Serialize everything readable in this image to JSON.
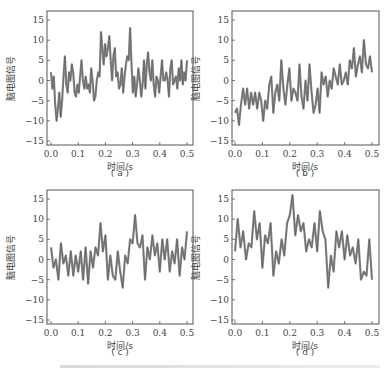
{
  "figure": {
    "ylabel": "脑电图信号",
    "xlabel": "时间/s",
    "caption_fragment": "……（部分被裁切的图注）"
  },
  "chart_data": [
    {
      "type": "line",
      "panel": "(a)",
      "xlabel": "时间/s",
      "ylabel": "脑电图信号",
      "xlim": [
        0,
        0.5
      ],
      "ylim": [
        -16,
        17
      ],
      "xticks": [
        "0.0",
        "0.1",
        "0.2",
        "0.3",
        "0.4",
        "0.5"
      ],
      "yticks": [
        "-15",
        "-10",
        "-5",
        "0",
        "5",
        "10",
        "15"
      ],
      "x": [
        0,
        0.01,
        0.02,
        0.025,
        0.03,
        0.035,
        0.04,
        0.045,
        0.05,
        0.055,
        0.06,
        0.065,
        0.07,
        0.075,
        0.08,
        0.085,
        0.09,
        0.095,
        0.1,
        0.105,
        0.11,
        0.115,
        0.12,
        0.125,
        0.13,
        0.135,
        0.14,
        0.145,
        0.15,
        0.155,
        0.16,
        0.165,
        0.17,
        0.175,
        0.18,
        0.185,
        0.19,
        0.195,
        0.2,
        0.205,
        0.21,
        0.215,
        0.22,
        0.225,
        0.23,
        0.235,
        0.24,
        0.245,
        0.25,
        0.255,
        0.26,
        0.265,
        0.27,
        0.275,
        0.28,
        0.285,
        0.29,
        0.295,
        0.3,
        0.305,
        0.31,
        0.315,
        0.32,
        0.325,
        0.33,
        0.335,
        0.34,
        0.345,
        0.35,
        0.355,
        0.36,
        0.365,
        0.37,
        0.375,
        0.38,
        0.385,
        0.39,
        0.395,
        0.4,
        0.405,
        0.41,
        0.415,
        0.42,
        0.425,
        0.43,
        0.435,
        0.44,
        0.445,
        0.45,
        0.455,
        0.46,
        0.465,
        0.47,
        0.475,
        0.48,
        0.485,
        0.49,
        0.495,
        0.5
      ],
      "values": [
        2,
        -2,
        1,
        -6,
        -10,
        -7,
        -3,
        -9,
        -5,
        1,
        6,
        -1,
        -3,
        2,
        0,
        4,
        2,
        -3,
        -4,
        -1,
        -3,
        1,
        5,
        0,
        -2,
        1,
        -2,
        -1,
        -3,
        3,
        0,
        -5,
        -4,
        0,
        2,
        1,
        12,
        8,
        4,
        9,
        6,
        8,
        11,
        5,
        0,
        6,
        8,
        1,
        2,
        -2,
        -1,
        3,
        -3,
        1,
        4,
        6,
        5,
        13,
        4,
        -3,
        1,
        -4,
        -1,
        3,
        0,
        -4,
        -1,
        5,
        -2,
        4,
        7,
        2,
        0,
        5,
        -1,
        -4,
        1,
        0,
        -3,
        1,
        5,
        0,
        0,
        2,
        0,
        -4,
        3,
        5,
        -1,
        0,
        1,
        -2,
        3,
        0,
        5,
        -1,
        2,
        0,
        5
      ],
      "color": "#555555"
    },
    {
      "type": "line",
      "panel": "(b)",
      "xlabel": "时间/s",
      "ylabel": "脑电图信号",
      "xlim": [
        0,
        0.5
      ],
      "ylim": [
        -16,
        17
      ],
      "xticks": [
        "0.0",
        "0.1",
        "0.2",
        "0.3",
        "0.4",
        "0.5"
      ],
      "yticks": [
        "-15",
        "-10",
        "-5",
        "0",
        "5",
        "10",
        "15"
      ],
      "values": [
        -8,
        -7,
        -11,
        -6,
        -2,
        -6,
        -2,
        -7,
        -3,
        -6,
        -3,
        -7,
        -3,
        -5,
        -10,
        -5,
        -7,
        -1,
        1,
        -8,
        -3,
        -1,
        -5,
        5,
        -2,
        -6,
        -1,
        3,
        -5,
        -2,
        -3,
        -5,
        4,
        -4,
        -7,
        0,
        -5,
        4,
        -3,
        -8,
        -6,
        -2,
        -8,
        2,
        -1,
        1,
        -4,
        0,
        -2,
        3,
        1,
        -1,
        4,
        -1,
        0,
        2,
        -1,
        5,
        3,
        8,
        1,
        4,
        6,
        2,
        10,
        4,
        3,
        6,
        2
      ],
      "color": "#555555"
    },
    {
      "type": "line",
      "panel": "(c)",
      "xlabel": "时间/s",
      "ylabel": "脑电图信号",
      "xlim": [
        0,
        0.5
      ],
      "ylim": [
        -16,
        17
      ],
      "xticks": [
        "0.0",
        "0.1",
        "0.2",
        "0.3",
        "0.4",
        "0.5"
      ],
      "yticks": [
        "-15",
        "-10",
        "-5",
        "0",
        "5",
        "10",
        "15"
      ],
      "values": [
        3,
        -2,
        0,
        -5,
        4,
        -1,
        1,
        -4,
        2,
        -4,
        1,
        -3,
        2,
        -5,
        3,
        -6,
        2,
        -2,
        3,
        1,
        9,
        2,
        6,
        -5,
        1,
        -4,
        -5,
        2,
        -3,
        -7,
        1,
        -1,
        5,
        4,
        11,
        4,
        3,
        6,
        -5,
        3,
        0,
        6,
        1,
        4,
        -3,
        5,
        0,
        5,
        -3,
        2,
        -1,
        5,
        -4,
        3,
        0,
        7
      ],
      "color": "#555555"
    },
    {
      "type": "line",
      "panel": "(d)",
      "xlabel": "时间/s",
      "ylabel": "脑电图信号",
      "xlim": [
        0,
        0.5
      ],
      "ylim": [
        -16,
        17
      ],
      "xticks": [
        "0.0",
        "0.1",
        "0.2",
        "0.3",
        "0.4",
        "0.5"
      ],
      "yticks": [
        "-15",
        "-10",
        "-5",
        "0",
        "5",
        "10",
        "15"
      ],
      "values": [
        2,
        10,
        3,
        7,
        0,
        4,
        3,
        12,
        5,
        9,
        -2,
        6,
        4,
        9,
        -4,
        2,
        -1,
        5,
        1,
        9,
        11,
        16,
        6,
        11,
        7,
        9,
        2,
        5,
        3,
        9,
        2,
        12,
        7,
        5,
        -7,
        1,
        -3,
        7,
        3,
        7,
        0,
        6,
        1,
        3,
        -1,
        5,
        -5,
        -3,
        -4,
        5,
        -5
      ],
      "color": "#555555"
    }
  ],
  "panels": [
    {
      "label": "(a)"
    },
    {
      "label": "(b)"
    },
    {
      "label": "(c)"
    },
    {
      "label": "(d)"
    }
  ]
}
